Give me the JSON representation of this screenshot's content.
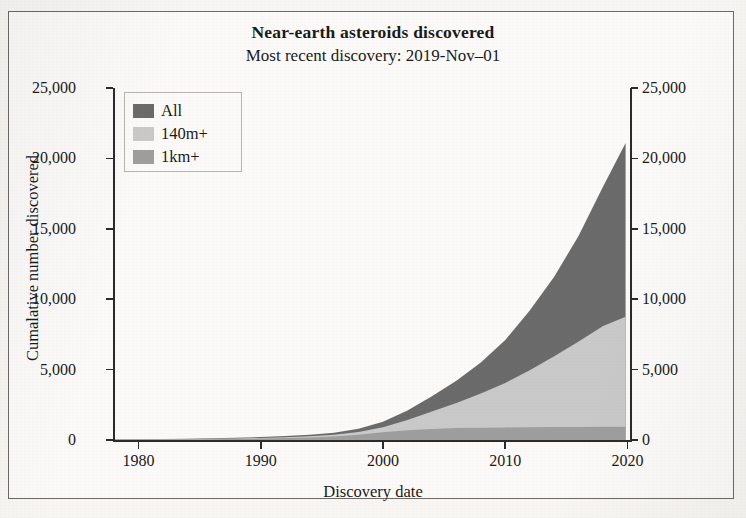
{
  "chart_data": {
    "type": "area",
    "title": "Near-earth asteroids discovered",
    "subtitle": "Most recent discovery: 2019-Nov–01",
    "xlabel": "Discovery date",
    "ylabel": "Cumalative number discovered",
    "stacked": true,
    "grid": false,
    "legend_position": "top-left",
    "xlim": [
      1978,
      2020.2
    ],
    "ylim": [
      0,
      25000
    ],
    "xticks": [
      1980,
      1990,
      2000,
      2010,
      2020
    ],
    "xtick_labels": [
      "1980",
      "1990",
      "2000",
      "2010",
      "2020"
    ],
    "yticks": [
      0,
      5000,
      10000,
      15000,
      20000,
      25000
    ],
    "ytick_labels": [
      "0",
      "5,000",
      "10,000",
      "15,000",
      "20,000",
      "25,000"
    ],
    "right_axis_ticks": [
      0,
      5000,
      10000,
      15000,
      20000,
      25000
    ],
    "right_axis_tick_labels": [
      "0",
      "5,000",
      "10,000",
      "15,000",
      "20,000",
      "25,000"
    ],
    "colors": {
      "all": "#6b6b6b",
      "m140": "#c9c9c9",
      "km1": "#9e9e9e"
    },
    "x": [
      1978,
      1980,
      1982,
      1984,
      1986,
      1988,
      1990,
      1992,
      1994,
      1996,
      1998,
      2000,
      2002,
      2004,
      2006,
      2008,
      2010,
      2012,
      2014,
      2016,
      2018,
      2019.84
    ],
    "series": [
      {
        "name": "All",
        "key": "all",
        "color": "#6b6b6b",
        "values": [
          50,
          60,
          75,
          95,
          120,
          160,
          210,
          280,
          380,
          520,
          800,
          1300,
          2100,
          3100,
          4200,
          5500,
          7100,
          9200,
          11600,
          14500,
          18000,
          21100
        ]
      },
      {
        "name": "140m+",
        "key": "m140",
        "color": "#c9c9c9",
        "values": [
          30,
          38,
          48,
          62,
          80,
          108,
          145,
          195,
          270,
          370,
          560,
          900,
          1420,
          2020,
          2620,
          3300,
          4050,
          4950,
          5950,
          7000,
          8100,
          8750
        ]
      },
      {
        "name": "1km+",
        "key": "km1",
        "color": "#9e9e9e",
        "values": [
          18,
          24,
          31,
          42,
          56,
          76,
          102,
          136,
          185,
          250,
          370,
          545,
          700,
          790,
          845,
          875,
          895,
          910,
          920,
          928,
          934,
          938
        ]
      }
    ]
  },
  "legend": {
    "items": [
      {
        "label": "All",
        "color": "#6b6b6b"
      },
      {
        "label": "140m+",
        "color": "#c9c9c9"
      },
      {
        "label": "1km+",
        "color": "#9e9e9e"
      }
    ]
  }
}
